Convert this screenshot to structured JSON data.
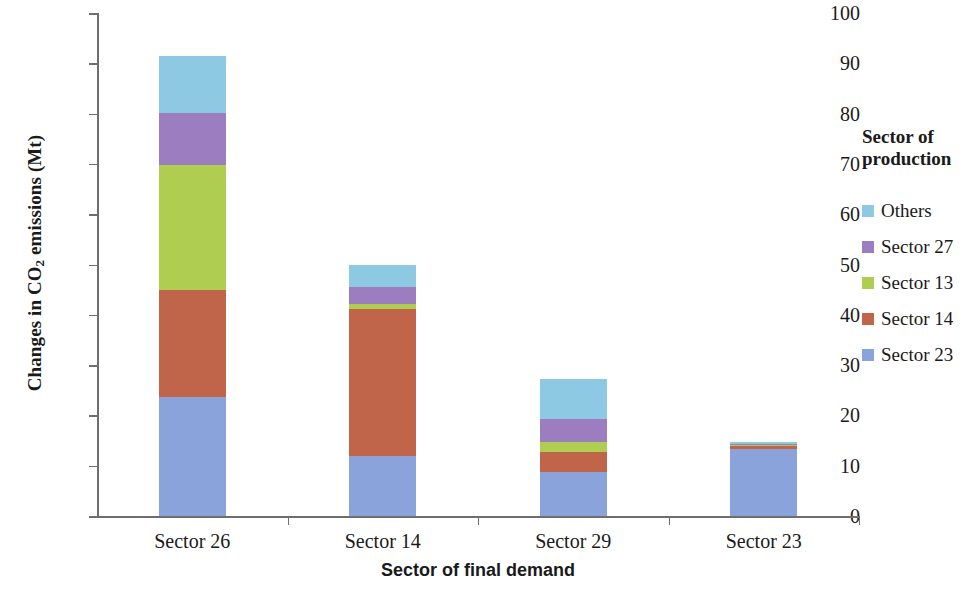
{
  "chart_data": {
    "type": "bar",
    "subtype": "stacked-vertical",
    "title": "",
    "xlabel": "Sector of final demand",
    "ylabel": "Changes in CO2 emissions (Mt)",
    "ylabel_rich": {
      "pre": "Changes in CO",
      "sub": "2",
      "post": " emissions (Mt)"
    },
    "categories": [
      "Sector 26",
      "Sector 14",
      "Sector 29",
      "Sector 23"
    ],
    "ylim": [
      0,
      100
    ],
    "yticks": [
      0,
      10,
      20,
      30,
      40,
      50,
      60,
      70,
      80,
      90,
      100
    ],
    "ytick_labels": [
      "0",
      "10",
      "20",
      "30",
      "40",
      "50",
      "60",
      "70",
      "80",
      "90",
      "100"
    ],
    "grid": false,
    "legend_position": "right",
    "legend_title": "Sector of production",
    "stack_order_bottom_to_top": [
      "Sector 23",
      "Sector 14",
      "Sector 13",
      "Sector 27",
      "Others"
    ],
    "series": [
      {
        "name": "Sector 23",
        "color": "#8BA3DB",
        "values": [
          23.7,
          12.0,
          8.8,
          13.4
        ]
      },
      {
        "name": "Sector 14",
        "color": "#C0654A",
        "values": [
          21.3,
          29.2,
          4.0,
          0.6
        ]
      },
      {
        "name": "Sector 13",
        "color": "#AECD51",
        "values": [
          24.8,
          1.0,
          2.0,
          0.2
        ]
      },
      {
        "name": "Sector 27",
        "color": "#9B7DC0",
        "values": [
          10.3,
          3.3,
          4.4,
          0.2
        ]
      },
      {
        "name": "Others",
        "color": "#8EC9E3",
        "values": [
          11.3,
          4.5,
          8.0,
          0.3
        ]
      }
    ],
    "totals": [
      90.6,
      50.0,
      27.2,
      14.7
    ]
  },
  "legend": {
    "title_line1": "Sector of",
    "title_line2": "production",
    "items": [
      {
        "label": "Others",
        "color": "#8EC9E3"
      },
      {
        "label": "Sector 27",
        "color": "#9B7DC0"
      },
      {
        "label": "Sector 13",
        "color": "#AECD51"
      },
      {
        "label": "Sector 14",
        "color": "#C0654A"
      },
      {
        "label": "Sector 23",
        "color": "#8BA3DB"
      }
    ]
  },
  "axes": {
    "x_title": "Sector of final demand",
    "y_title_pre": "Changes in CO",
    "y_title_sub": "2",
    "y_title_post": " emissions (Mt)"
  }
}
